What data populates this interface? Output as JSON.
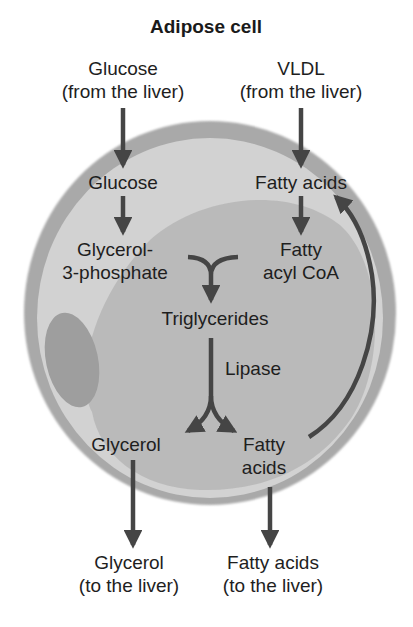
{
  "title": "Adipose cell",
  "colors": {
    "membrane": "#a9a9a9",
    "cytoplasm": "#d2d2d2",
    "lipid_droplet": "#b6b6b6",
    "nucleus": "#9c9c9c",
    "arrow": "#454545",
    "text": "#1e1e1e"
  },
  "inputs": {
    "glucose": {
      "line1": "Glucose",
      "line2": "(from the liver)"
    },
    "vldl": {
      "line1": "VLDL",
      "line2": "(from the liver)"
    }
  },
  "intracellular": {
    "glucose": "Glucose",
    "fatty_acids_top": "Fatty acids",
    "glycerol_3_phosphate": {
      "line1": "Glycerol-",
      "line2": "3-phosphate"
    },
    "fatty_acyl_coa": {
      "line1": "Fatty",
      "line2": "acyl CoA"
    },
    "triglycerides": "Triglycerides",
    "lipase": "Lipase",
    "glycerol": "Glycerol",
    "fatty_acids_bottom": {
      "line1": "Fatty",
      "line2": "acids"
    }
  },
  "outputs": {
    "glycerol": {
      "line1": "Glycerol",
      "line2": "(to the liver)"
    },
    "fatty_acids": {
      "line1": "Fatty acids",
      "line2": "(to the liver)"
    }
  },
  "edges": [
    {
      "from": "Glucose (from the liver)",
      "to": "Glucose"
    },
    {
      "from": "VLDL (from the liver)",
      "to": "Fatty acids"
    },
    {
      "from": "Glucose",
      "to": "Glycerol-3-phosphate"
    },
    {
      "from": "Fatty acids",
      "to": "Fatty acyl CoA"
    },
    {
      "from": "Glycerol-3-phosphate + Fatty acyl CoA",
      "to": "Triglycerides"
    },
    {
      "from": "Triglycerides",
      "to": "Glycerol",
      "label": "Lipase"
    },
    {
      "from": "Triglycerides",
      "to": "Fatty acids (bottom)",
      "label": "Lipase"
    },
    {
      "from": "Fatty acids (bottom)",
      "to": "Fatty acids (top)"
    },
    {
      "from": "Glycerol",
      "to": "Glycerol (to the liver)"
    },
    {
      "from": "Fatty acids (bottom)",
      "to": "Fatty acids (to the liver)"
    }
  ]
}
